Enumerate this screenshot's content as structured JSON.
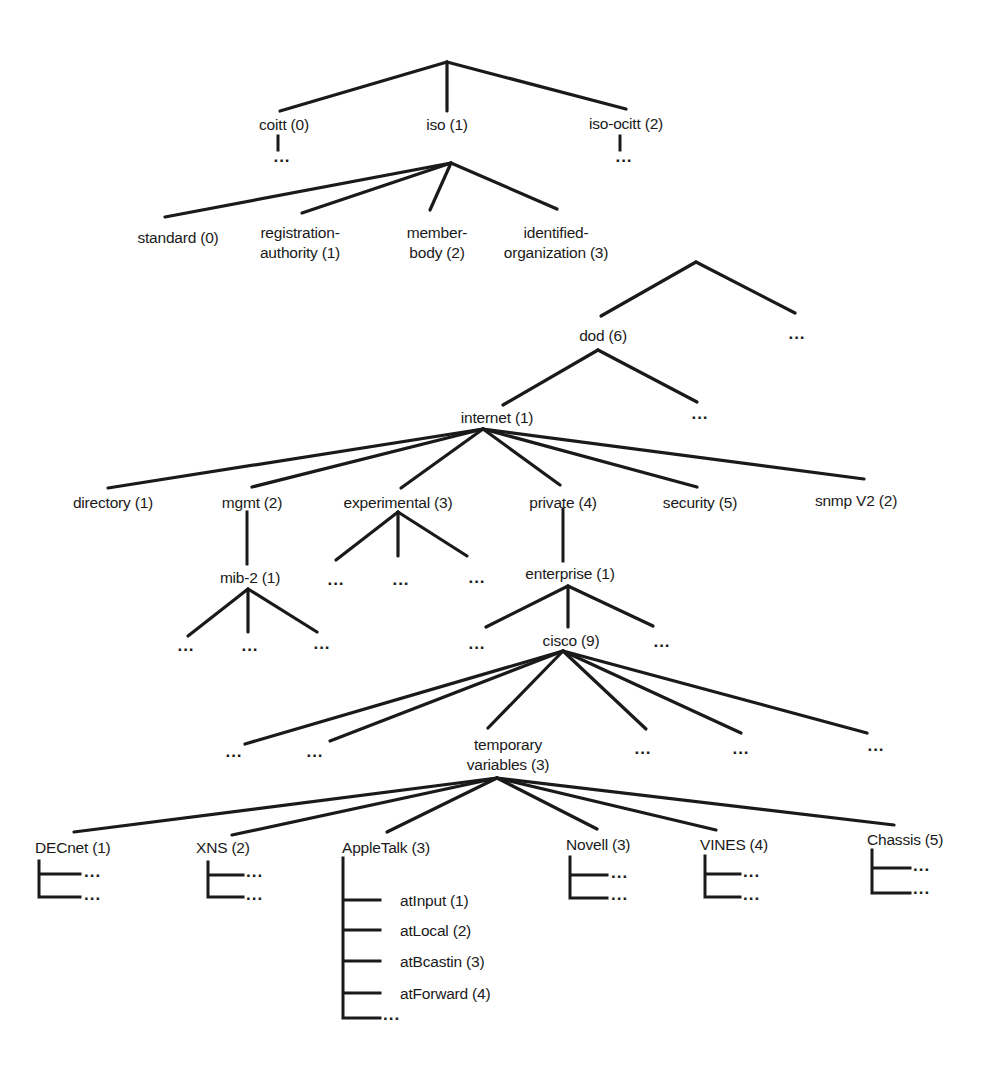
{
  "diagram": {
    "title": "",
    "ellipsis": "...",
    "nodes": {
      "coitt": "coitt (0)",
      "iso": "iso (1)",
      "iso_ocitt": "iso-ocitt (2)",
      "standard": "standard (0)",
      "registration_authority_1": "registration-",
      "registration_authority_2": "authority (1)",
      "member_body_1": "member-",
      "member_body_2": "body (2)",
      "identified_organization_1": "identified-",
      "identified_organization_2": "organization (3)",
      "dod": "dod (6)",
      "internet": "internet (1)",
      "directory": "directory (1)",
      "mgmt": "mgmt (2)",
      "experimental": "experimental (3)",
      "private": "private (4)",
      "security": "security (5)",
      "snmp_v2": "snmp V2 (2)",
      "mib_2": "mib-2 (1)",
      "enterprise": "enterprise (1)",
      "cisco": "cisco (9)",
      "temporary_variables_1": "temporary",
      "temporary_variables_2": "variables (3)",
      "decnet": "DECnet (1)",
      "xns": "XNS (2)",
      "appletalk": "AppleTalk (3)",
      "novell": "Novell (3)",
      "vines": "VINES (4)",
      "chassis": "Chassis (5)",
      "at_input": "atInput (1)",
      "at_local": "atLocal (2)",
      "at_bcastin": "atBcastin (3)",
      "at_forward": "atForward (4)"
    },
    "edges": [
      [
        "root",
        "coitt"
      ],
      [
        "root",
        "iso"
      ],
      [
        "root",
        "iso-ocitt"
      ],
      [
        "iso",
        "standard"
      ],
      [
        "iso",
        "registration-authority"
      ],
      [
        "iso",
        "member-body"
      ],
      [
        "iso",
        "identified-organization"
      ],
      [
        "identified-organization",
        "dod"
      ],
      [
        "identified-organization",
        "..."
      ],
      [
        "dod",
        "internet"
      ],
      [
        "dod",
        "..."
      ],
      [
        "internet",
        "directory"
      ],
      [
        "internet",
        "mgmt"
      ],
      [
        "internet",
        "experimental"
      ],
      [
        "internet",
        "private"
      ],
      [
        "internet",
        "security"
      ],
      [
        "internet",
        "snmp V2"
      ],
      [
        "mgmt",
        "mib-2"
      ],
      [
        "experimental",
        "..."
      ],
      [
        "private",
        "enterprise"
      ],
      [
        "enterprise",
        "cisco"
      ],
      [
        "cisco",
        "temporary variables"
      ],
      [
        "temporary variables",
        "DECnet"
      ],
      [
        "temporary variables",
        "XNS"
      ],
      [
        "temporary variables",
        "AppleTalk"
      ],
      [
        "temporary variables",
        "Novell"
      ],
      [
        "temporary variables",
        "VINES"
      ],
      [
        "temporary variables",
        "Chassis"
      ],
      [
        "AppleTalk",
        "atInput"
      ],
      [
        "AppleTalk",
        "atLocal"
      ],
      [
        "AppleTalk",
        "atBcastin"
      ],
      [
        "AppleTalk",
        "atForward"
      ]
    ]
  }
}
